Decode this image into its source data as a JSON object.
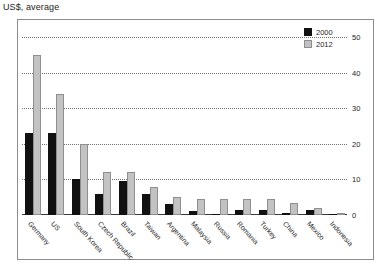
{
  "title": "US$, average",
  "legend": {
    "position": "top-right",
    "entries": [
      {
        "label": "2000",
        "color": "#111111"
      },
      {
        "label": "2012",
        "color": "#c2c2c2"
      }
    ]
  },
  "chart_data": {
    "type": "bar",
    "title": "US$, average",
    "xlabel": "",
    "ylabel": "",
    "ylim": [
      0,
      50
    ],
    "yticks": [
      0,
      10,
      20,
      30,
      40,
      50
    ],
    "grid": true,
    "y_axis_side": "right",
    "categories": [
      "Germany",
      "US",
      "South Korea",
      "Czech Republic",
      "Brazil",
      "Taiwan",
      "Argentina",
      "Malaysia",
      "Russia",
      "Romania",
      "Turkey",
      "China",
      "Mexico",
      "Indonesia"
    ],
    "series": [
      {
        "name": "2000",
        "color": "#111111",
        "values": [
          23,
          23,
          10,
          6,
          9.5,
          6,
          3,
          1,
          0.3,
          1.5,
          1.5,
          0.7,
          1.5,
          0.2
        ]
      },
      {
        "name": "2012",
        "color": "#c2c2c2",
        "values": [
          45,
          34,
          20,
          12,
          12,
          8,
          5,
          4.5,
          4.5,
          4.5,
          4.5,
          3.5,
          2,
          0.6
        ]
      }
    ]
  }
}
